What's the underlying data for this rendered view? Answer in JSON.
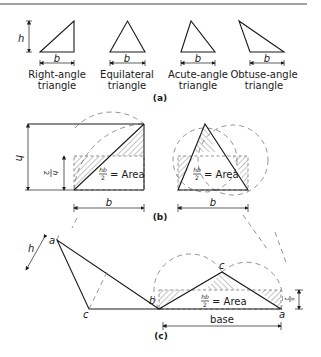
{
  "section_a": {
    "caption": "(a)",
    "triangles": [
      {
        "name": "Right-angle",
        "line2": "triangle",
        "height_label": "h",
        "base_label": "b"
      },
      {
        "name": "Equilateral",
        "line2": "triangle",
        "base_label": "b"
      },
      {
        "name": "Acute-angle",
        "line2": "triangle",
        "base_label": "b"
      },
      {
        "name": "Obtuse-angle",
        "line2": "triangle",
        "base_label": "b"
      }
    ]
  },
  "section_b": {
    "caption": "(b)",
    "left": {
      "height_label": "h",
      "half_height_num": "h",
      "half_height_den": "2",
      "area_num": "hb",
      "area_den": "2",
      "area_text": "= Area",
      "base_label": "b"
    },
    "right": {
      "area_num": "hb",
      "area_den": "2",
      "area_text": "= Area",
      "base_label": "b"
    }
  },
  "section_c": {
    "caption": "(c)",
    "height_label": "h",
    "vertex_a": "a",
    "vertex_b": "b",
    "vertex_c": "c",
    "right_vertex_a": "a",
    "right_vertex_b": "b",
    "right_vertex_c": "c",
    "half_h_num": "h",
    "half_h_den": "2",
    "area_num": "hb",
    "area_den": "2",
    "area_text": "= Area",
    "base_label": "base"
  }
}
